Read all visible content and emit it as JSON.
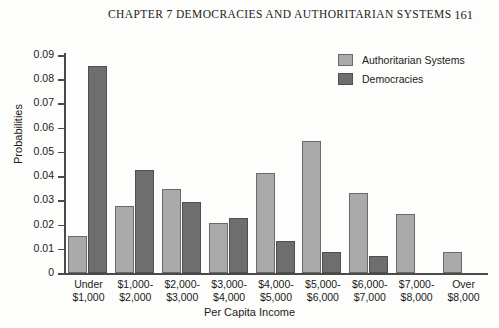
{
  "header": {
    "chapter_title": "CHAPTER 7    DEMOCRACIES AND AUTHORITARIAN SYSTEMS",
    "page_number": "161"
  },
  "chart_data": {
    "type": "bar",
    "title": "",
    "xlabel": "Per Capita Income",
    "ylabel": "Probabilities",
    "ylim": [
      0,
      0.09
    ],
    "ytick_labels": [
      "0.09",
      "0.08",
      "0.07",
      "0.06",
      "0.05",
      "0.04",
      "0.03",
      "0.02",
      "0.01",
      "0"
    ],
    "ytick_values": [
      0.09,
      0.08,
      0.07,
      0.06,
      0.05,
      0.04,
      0.03,
      0.02,
      0.01,
      0
    ],
    "grid": false,
    "legend_position": "top-right",
    "categories": [
      "Under $1,000",
      "$1,000-$2,000",
      "$2,000-$3,000",
      "$3,000-$4,000",
      "$4,000-$5,000",
      "$5,000-$6,000",
      "$6,000-$7,000",
      "$7,000-$8,000",
      "Over $8,000"
    ],
    "category_lines": [
      [
        "Under",
        "$1,000"
      ],
      [
        "$1,000-",
        "$2,000"
      ],
      [
        "$2,000-",
        "$3,000"
      ],
      [
        "$3,000-",
        "$4,000"
      ],
      [
        "$4,000-",
        "$5,000"
      ],
      [
        "$5,000-",
        "$6,000"
      ],
      [
        "$6,000-",
        "$7,000"
      ],
      [
        "$7,000-",
        "$8,000"
      ],
      [
        "Over",
        "$8,000"
      ]
    ],
    "series": [
      {
        "name": "Authoritarian Systems",
        "color": "#aaaaaa",
        "values": [
          0.0152,
          0.0276,
          0.0345,
          0.0208,
          0.0412,
          0.0547,
          0.0332,
          0.0243,
          0.0086
        ]
      },
      {
        "name": "Democracies",
        "color": "#6e6e6e",
        "values": [
          0.0855,
          0.0427,
          0.0293,
          0.0229,
          0.0133,
          0.0085,
          0.0069,
          null,
          null
        ]
      }
    ]
  },
  "legend": {
    "items": [
      {
        "label": "Authoritarian Systems",
        "color": "#aaaaaa"
      },
      {
        "label": "Democracies",
        "color": "#6e6e6e"
      }
    ]
  }
}
